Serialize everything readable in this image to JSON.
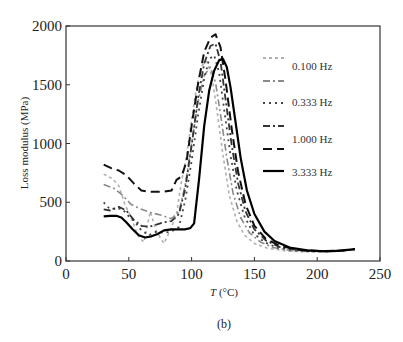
{
  "chart_data": {
    "type": "line",
    "title": "",
    "xlabel": "T (°C)",
    "xlabel_italic_part": "T",
    "xlabel_unit": " (°C)",
    "ylabel": "Loss modulus (MPa)",
    "caption": "(b)",
    "xlim": [
      0,
      250
    ],
    "ylim": [
      0,
      2000
    ],
    "xticks": [
      0,
      50,
      100,
      150,
      200,
      250
    ],
    "yticks": [
      0,
      500,
      1000,
      1500,
      2000
    ],
    "grid": false,
    "legend_position": "upper right (inside)",
    "legend_labels": [
      "0.100 Hz",
      "0.333 Hz",
      "1.000 Hz",
      "3.333 Hz"
    ],
    "series": [
      {
        "name": "0.100 Hz (a)",
        "style": "short-dash",
        "color": "#b0b0b0",
        "width": 1.6,
        "points": [
          [
            30,
            740
          ],
          [
            37,
            700
          ],
          [
            42,
            640
          ],
          [
            47,
            480
          ],
          [
            52,
            370
          ],
          [
            57,
            220
          ],
          [
            62,
            160
          ],
          [
            67,
            420
          ],
          [
            72,
            250
          ],
          [
            78,
            150
          ],
          [
            83,
            260
          ],
          [
            88,
            400
          ],
          [
            92,
            680
          ],
          [
            96,
            900
          ],
          [
            100,
            1200
          ],
          [
            104,
            1480
          ],
          [
            108,
            1660
          ],
          [
            112,
            1700
          ],
          [
            116,
            1580
          ],
          [
            120,
            1300
          ],
          [
            125,
            900
          ],
          [
            130,
            560
          ],
          [
            136,
            340
          ],
          [
            142,
            220
          ],
          [
            150,
            150
          ],
          [
            160,
            110
          ],
          [
            175,
            85
          ],
          [
            190,
            78
          ],
          [
            205,
            80
          ],
          [
            220,
            88
          ],
          [
            230,
            100
          ]
        ]
      },
      {
        "name": "0.100 Hz (b)",
        "style": "dash-dot",
        "color": "#8a8a8a",
        "width": 1.6,
        "points": [
          [
            30,
            650
          ],
          [
            38,
            620
          ],
          [
            45,
            560
          ],
          [
            52,
            480
          ],
          [
            60,
            440
          ],
          [
            68,
            410
          ],
          [
            76,
            390
          ],
          [
            84,
            360
          ],
          [
            90,
            420
          ],
          [
            95,
            650
          ],
          [
            100,
            1000
          ],
          [
            105,
            1350
          ],
          [
            110,
            1580
          ],
          [
            115,
            1650
          ],
          [
            119,
            1520
          ],
          [
            123,
            1250
          ],
          [
            128,
            880
          ],
          [
            133,
            580
          ],
          [
            139,
            370
          ],
          [
            146,
            240
          ],
          [
            155,
            160
          ],
          [
            165,
            115
          ],
          [
            180,
            88
          ],
          [
            195,
            80
          ],
          [
            210,
            82
          ],
          [
            222,
            90
          ],
          [
            230,
            100
          ]
        ]
      },
      {
        "name": "0.333 Hz",
        "style": "dotted",
        "color": "#444444",
        "width": 1.8,
        "points": [
          [
            30,
            500
          ],
          [
            35,
            440
          ],
          [
            40,
            450
          ],
          [
            45,
            440
          ],
          [
            50,
            380
          ],
          [
            55,
            330
          ],
          [
            60,
            260
          ],
          [
            66,
            220
          ],
          [
            72,
            250
          ],
          [
            78,
            240
          ],
          [
            84,
            250
          ],
          [
            90,
            290
          ],
          [
            95,
            520
          ],
          [
            100,
            850
          ],
          [
            105,
            1230
          ],
          [
            110,
            1550
          ],
          [
            114,
            1720
          ],
          [
            118,
            1750
          ],
          [
            122,
            1600
          ],
          [
            126,
            1280
          ],
          [
            131,
            900
          ],
          [
            136,
            600
          ],
          [
            142,
            380
          ],
          [
            149,
            240
          ],
          [
            158,
            160
          ],
          [
            168,
            115
          ],
          [
            182,
            90
          ],
          [
            197,
            82
          ],
          [
            212,
            84
          ],
          [
            224,
            92
          ],
          [
            230,
            100
          ]
        ]
      },
      {
        "name": "1.000 Hz (a)",
        "style": "dash-dot",
        "color": "#333333",
        "width": 1.8,
        "points": [
          [
            30,
            440
          ],
          [
            35,
            430
          ],
          [
            42,
            460
          ],
          [
            48,
            430
          ],
          [
            54,
            350
          ],
          [
            60,
            300
          ],
          [
            66,
            290
          ],
          [
            72,
            310
          ],
          [
            78,
            330
          ],
          [
            84,
            340
          ],
          [
            90,
            400
          ],
          [
            95,
            620
          ],
          [
            100,
            980
          ],
          [
            105,
            1380
          ],
          [
            110,
            1680
          ],
          [
            115,
            1830
          ],
          [
            119,
            1850
          ],
          [
            123,
            1700
          ],
          [
            127,
            1380
          ],
          [
            132,
            980
          ],
          [
            137,
            660
          ],
          [
            143,
            420
          ],
          [
            150,
            270
          ],
          [
            159,
            175
          ],
          [
            170,
            120
          ],
          [
            185,
            92
          ],
          [
            200,
            84
          ],
          [
            215,
            86
          ],
          [
            230,
            100
          ]
        ]
      },
      {
        "name": "1.000 Hz (b)",
        "style": "long-dash",
        "color": "#111111",
        "width": 2.0,
        "points": [
          [
            30,
            820
          ],
          [
            36,
            790
          ],
          [
            42,
            770
          ],
          [
            48,
            730
          ],
          [
            54,
            660
          ],
          [
            60,
            600
          ],
          [
            66,
            590
          ],
          [
            72,
            590
          ],
          [
            78,
            590
          ],
          [
            84,
            600
          ],
          [
            88,
            690
          ],
          [
            92,
            720
          ],
          [
            96,
            850
          ],
          [
            100,
            1150
          ],
          [
            105,
            1500
          ],
          [
            110,
            1780
          ],
          [
            115,
            1900
          ],
          [
            119,
            1930
          ],
          [
            123,
            1820
          ],
          [
            127,
            1540
          ],
          [
            132,
            1120
          ],
          [
            137,
            760
          ],
          [
            143,
            480
          ],
          [
            150,
            300
          ],
          [
            159,
            190
          ],
          [
            170,
            130
          ],
          [
            185,
            95
          ],
          [
            200,
            85
          ],
          [
            215,
            87
          ],
          [
            230,
            100
          ]
        ]
      },
      {
        "name": "3.333 Hz",
        "style": "solid",
        "color": "#000000",
        "width": 2.2,
        "points": [
          [
            30,
            380
          ],
          [
            35,
            385
          ],
          [
            40,
            385
          ],
          [
            44,
            370
          ],
          [
            48,
            330
          ],
          [
            53,
            270
          ],
          [
            58,
            220
          ],
          [
            63,
            200
          ],
          [
            68,
            210
          ],
          [
            73,
            230
          ],
          [
            78,
            260
          ],
          [
            84,
            270
          ],
          [
            90,
            270
          ],
          [
            95,
            270
          ],
          [
            99,
            280
          ],
          [
            102,
            320
          ],
          [
            106,
            700
          ],
          [
            110,
            1150
          ],
          [
            114,
            1450
          ],
          [
            118,
            1620
          ],
          [
            122,
            1710
          ],
          [
            125,
            1720
          ],
          [
            128,
            1650
          ],
          [
            131,
            1480
          ],
          [
            135,
            1180
          ],
          [
            139,
            880
          ],
          [
            144,
            600
          ],
          [
            150,
            400
          ],
          [
            158,
            250
          ],
          [
            166,
            170
          ],
          [
            178,
            115
          ],
          [
            192,
            90
          ],
          [
            207,
            82
          ],
          [
            220,
            88
          ],
          [
            230,
            102
          ]
        ]
      }
    ],
    "legend_entries": [
      {
        "label": "",
        "style": "short-dash",
        "color": "#b0b0b0"
      },
      {
        "label": "0.100 Hz",
        "style": "dash-dot",
        "color": "#8a8a8a"
      },
      {
        "label": "0.333 Hz",
        "style": "dotted",
        "color": "#444444"
      },
      {
        "label": "",
        "style": "dash-dot",
        "color": "#333333"
      },
      {
        "label": "1.000 Hz",
        "style": "long-dash",
        "color": "#111111"
      },
      {
        "label": "3.333 Hz",
        "style": "solid",
        "color": "#000000"
      }
    ]
  }
}
